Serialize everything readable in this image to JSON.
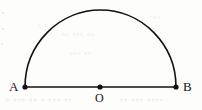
{
  "figure": {
    "type": "geometry-diagram",
    "width": 202,
    "height": 110,
    "background_color": "#fdfdfc",
    "stroke_color": "#111111",
    "stroke_width": 1.6,
    "point_radius": 2.6,
    "points": [
      {
        "id": "A",
        "label": "A",
        "x": 25,
        "y": 87,
        "label_x": 9,
        "label_y": 80
      },
      {
        "id": "O",
        "label": "O",
        "x": 100,
        "y": 87,
        "label_x": 95,
        "label_y": 92
      },
      {
        "id": "B",
        "label": "B",
        "x": 176,
        "y": 87,
        "label_x": 183,
        "label_y": 80
      }
    ],
    "segment": {
      "name": "AB",
      "from": "A",
      "to": "B",
      "x1": 25,
      "y1": 87,
      "x2": 176,
      "y2": 87
    },
    "arc": {
      "name": "semicircle-arc-AB",
      "center_x": 100,
      "center_y": 87,
      "radius_x": 75.5,
      "radius_y": 77,
      "start_x": 25,
      "start_y": 87,
      "end_x": 176,
      "end_y": 87,
      "apex_x": 100,
      "apex_y": 10,
      "sweep": "upper"
    }
  },
  "artifacts": {
    "note": "faint scanner bleed-through from reverse page",
    "marks": [
      {
        "text": "•",
        "x": 2,
        "y": 12,
        "size": 7
      },
      {
        "text": "•",
        "x": 2,
        "y": 28,
        "size": 7
      },
      {
        "text": "•",
        "x": 1,
        "y": 44,
        "size": 6
      },
      {
        "text": "▫ ▫ ▫",
        "x": 38,
        "y": 24,
        "size": 8
      },
      {
        "text": "▫▫ ▫▫▫ ▫▫",
        "x": 62,
        "y": 33,
        "size": 8
      },
      {
        "text": "▫▫▫ ▫▫",
        "x": 70,
        "y": 52,
        "size": 8
      },
      {
        "text": "▫ ▫▫▫ ▫▫ ▫ ▫▫▫ ▫▫",
        "x": 6,
        "y": 98,
        "size": 9
      },
      {
        "text": "▫▫ ▫▫▫ ▫▫▫▫",
        "x": 120,
        "y": 98,
        "size": 9
      },
      {
        "text": "▫▫▫",
        "x": 150,
        "y": 16,
        "size": 8
      }
    ]
  }
}
